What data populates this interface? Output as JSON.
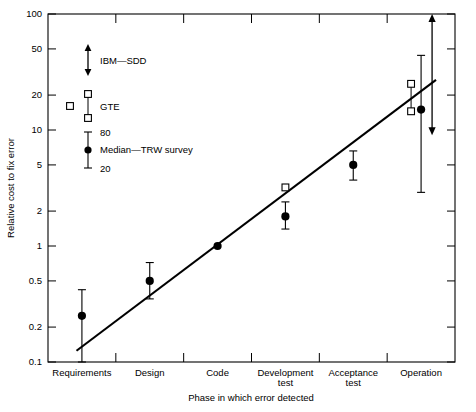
{
  "chart_data": {
    "type": "scatter",
    "title": "",
    "xlabel": "Phase in which error detected",
    "ylabel": "Relative cost to fix error",
    "yscale": "log",
    "ylim": [
      0.1,
      100
    ],
    "grid": false,
    "legend_position": "inside-upper-left",
    "categories": [
      "Requirements",
      "Design",
      "Code",
      "Development test",
      "Acceptance test",
      "Operation"
    ],
    "ytick_labels": [
      "0.1",
      "0.2",
      "0.5",
      "1",
      "2",
      "5",
      "10",
      "20",
      "50",
      "100"
    ],
    "ytick_values": [
      0.1,
      0.2,
      0.5,
      1,
      2,
      5,
      10,
      20,
      50,
      100
    ],
    "series": [
      {
        "name": "Median—TRW survey",
        "marker": "filled-circle",
        "values": [
          0.25,
          0.5,
          1.0,
          1.8,
          5.0,
          15.0
        ],
        "error_low": [
          0.1,
          0.35,
          1.0,
          1.4,
          3.7,
          2.9
        ],
        "error_high": [
          0.42,
          0.72,
          1.0,
          2.4,
          6.6,
          44.0
        ],
        "error_note": "bars span 20th to 80th percentile"
      },
      {
        "name": "GTE",
        "marker": "open-square",
        "points": [
          {
            "category": "Development test",
            "value": 3.2
          },
          {
            "category": "Operation",
            "value": 25.0
          },
          {
            "category": "Operation",
            "value": 14.5
          }
        ]
      },
      {
        "name": "IBM-SDD",
        "marker": "double-arrow",
        "points": [
          {
            "category": "Operation",
            "low": 9.0,
            "high": 100.0
          }
        ]
      }
    ],
    "trend_line": {
      "x_start_category_fraction": 0.42,
      "y_start": 0.125,
      "x_end_category_fraction": 5.72,
      "y_end": 27.0
    },
    "annotations": [
      {
        "text": "80",
        "meaning": "80th percentile marker on legend"
      },
      {
        "text": "20",
        "meaning": "20th percentile marker on legend"
      }
    ]
  },
  "legend": {
    "entries": [
      {
        "label": "IBM—SDD",
        "marker": "double-arrow"
      },
      {
        "label": "GTE",
        "marker": "open-square"
      },
      {
        "label": "Median—TRW survey",
        "marker": "filled-circle"
      }
    ],
    "percentile_high": "80",
    "percentile_low": "20"
  },
  "colors": {
    "ink": "#000000",
    "background": "#ffffff"
  }
}
